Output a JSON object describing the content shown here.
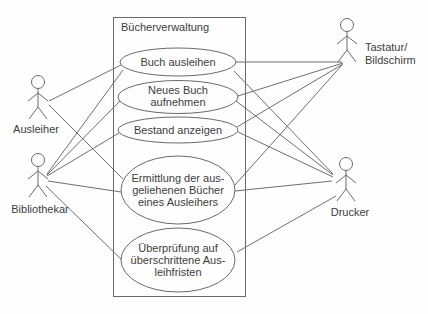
{
  "diagram": {
    "type": "uml-use-case",
    "system": {
      "title": "Bücherverwaltung"
    },
    "use_cases": [
      {
        "id": "buch-ausleihen",
        "lines": [
          "Buch ausleihen"
        ]
      },
      {
        "id": "neues-buch-aufnehmen",
        "lines": [
          "Neues Buch",
          "aufnehmen"
        ]
      },
      {
        "id": "bestand-anzeigen",
        "lines": [
          "Bestand anzeigen"
        ]
      },
      {
        "id": "ermittlung-ausgeliehene-buecher",
        "lines": [
          "Ermittlung der aus-",
          "geliehenen Bücher",
          "eines Ausleihers"
        ]
      },
      {
        "id": "ueberpruefung-ausleihfristen",
        "lines": [
          "Überprüfung auf",
          "überschrittene Aus-",
          "leihfristen"
        ]
      }
    ],
    "actors": [
      {
        "id": "ausleiher",
        "lines": [
          "Ausleiher"
        ]
      },
      {
        "id": "bibliothekar",
        "lines": [
          "Bibliothekar"
        ]
      },
      {
        "id": "tastatur-bildschirm",
        "lines": [
          "Tastatur/",
          "Bildschirm"
        ]
      },
      {
        "id": "drucker",
        "lines": [
          "Drucker"
        ]
      }
    ],
    "connections": [
      {
        "from": "Ausleiher",
        "to": "Buch ausleihen"
      },
      {
        "from": "Ausleiher",
        "to": "Ermittlung der ausgeliehenen Bücher eines Ausleihers"
      },
      {
        "from": "Bibliothekar",
        "to": "Buch ausleihen"
      },
      {
        "from": "Bibliothekar",
        "to": "Neues Buch aufnehmen"
      },
      {
        "from": "Bibliothekar",
        "to": "Bestand anzeigen"
      },
      {
        "from": "Bibliothekar",
        "to": "Ermittlung der ausgeliehenen Bücher eines Ausleihers"
      },
      {
        "from": "Bibliothekar",
        "to": "Überprüfung auf überschrittene Ausleihfristen"
      },
      {
        "from": "Tastatur/Bildschirm",
        "to": "Buch ausleihen"
      },
      {
        "from": "Tastatur/Bildschirm",
        "to": "Neues Buch aufnehmen"
      },
      {
        "from": "Tastatur/Bildschirm",
        "to": "Bestand anzeigen"
      },
      {
        "from": "Tastatur/Bildschirm",
        "to": "Ermittlung der ausgeliehenen Bücher eines Ausleihers"
      },
      {
        "from": "Drucker",
        "to": "Buch ausleihen"
      },
      {
        "from": "Drucker",
        "to": "Neues Buch aufnehmen"
      },
      {
        "from": "Drucker",
        "to": "Bestand anzeigen"
      },
      {
        "from": "Drucker",
        "to": "Ermittlung der ausgeliehenen Bücher eines Ausleihers"
      },
      {
        "from": "Drucker",
        "to": "Überprüfung auf überschrittene Ausleihfristen"
      }
    ],
    "colors": {
      "background": "#fefefe",
      "line": "#6f6f6f",
      "text": "#3d3d3d"
    }
  }
}
